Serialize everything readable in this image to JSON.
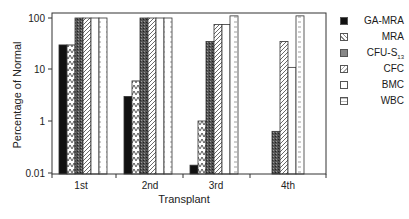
{
  "chart_data": {
    "type": "bar",
    "title": "",
    "xlabel": "Transplant",
    "ylabel": "Percentage of Normal",
    "yscale": "log",
    "ytick_labels": [
      "100",
      "10",
      "1",
      "0.01"
    ],
    "ylim": [
      0.01,
      100
    ],
    "grid": false,
    "legend_position": "right",
    "categories": [
      "1st",
      "2nd",
      "3rd",
      "4th"
    ],
    "series": [
      {
        "name": "GA-MRA",
        "pattern": "solid-black",
        "values": [
          30,
          3,
          0.02,
          null
        ]
      },
      {
        "name": "MRA",
        "pattern": "zigzag",
        "values": [
          30,
          6,
          1,
          null
        ]
      },
      {
        "name": "CFU-S13",
        "pattern": "dark-stipple",
        "values": [
          100,
          100,
          35,
          0.4
        ]
      },
      {
        "name": "CFC",
        "pattern": "diagonal-hatch",
        "values": [
          100,
          100,
          75,
          35
        ]
      },
      {
        "name": "BMC",
        "pattern": "white",
        "values": [
          100,
          100,
          75,
          11
        ]
      },
      {
        "name": "WBC",
        "pattern": "dotted-lines",
        "values": [
          100,
          100,
          110,
          110
        ]
      }
    ]
  },
  "legend": {
    "items": [
      {
        "label": "GA-MRA",
        "sub": ""
      },
      {
        "label": "MRA",
        "sub": ""
      },
      {
        "label": "CFU-S",
        "sub": "13"
      },
      {
        "label": "CFC",
        "sub": ""
      },
      {
        "label": "BMC",
        "sub": ""
      },
      {
        "label": "WBC",
        "sub": ""
      }
    ]
  }
}
